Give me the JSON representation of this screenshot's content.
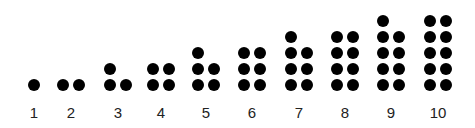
{
  "diagram": {
    "title": "",
    "dot_color": "#000000",
    "items": [
      {
        "label": "1",
        "count": 1,
        "cx": 34
      },
      {
        "label": "2",
        "count": 2,
        "cx": 71
      },
      {
        "label": "3",
        "count": 3,
        "cx": 118
      },
      {
        "label": "4",
        "count": 4,
        "cx": 161
      },
      {
        "label": "5",
        "count": 5,
        "cx": 206
      },
      {
        "label": "6",
        "count": 6,
        "cx": 252
      },
      {
        "label": "7",
        "count": 7,
        "cx": 299
      },
      {
        "label": "8",
        "count": 8,
        "cx": 345
      },
      {
        "label": "9",
        "count": 9,
        "cx": 391
      },
      {
        "label": "10",
        "count": 10,
        "cx": 438
      }
    ]
  }
}
